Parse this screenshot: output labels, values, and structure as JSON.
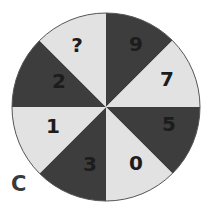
{
  "puzzle": {
    "label": "C",
    "colors": {
      "dark": "#3d3d3d",
      "light": "#e2e2e2",
      "text": "#1c1c1c",
      "outline": "#555555"
    },
    "segments": [
      {
        "position": "top-right",
        "value": "9",
        "shade": "dark"
      },
      {
        "position": "right-top",
        "value": "7",
        "shade": "light"
      },
      {
        "position": "right-bottom",
        "value": "5",
        "shade": "dark"
      },
      {
        "position": "bottom-right",
        "value": "0",
        "shade": "light"
      },
      {
        "position": "bottom-left",
        "value": "3",
        "shade": "dark"
      },
      {
        "position": "left-bottom",
        "value": "1",
        "shade": "light"
      },
      {
        "position": "left-top",
        "value": "2",
        "shade": "dark"
      },
      {
        "position": "top-left",
        "value": "?",
        "shade": "light"
      }
    ]
  }
}
